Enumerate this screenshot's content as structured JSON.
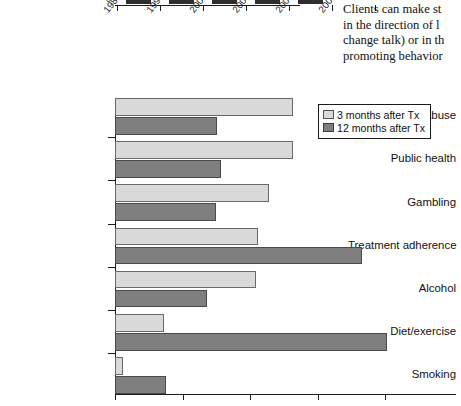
{
  "page": {
    "background": "#ffffff",
    "series_colors": {
      "light": "#d9d9d9",
      "dark": "#7f7f7f",
      "axis": "#1a1a1a"
    }
  },
  "body_text": {
    "lines": [
      "Clients can make st",
      "in the direction of l",
      "change talk) or in th",
      "promoting behavior"
    ]
  },
  "top_chart": {
    "axis_zero_label": "0",
    "tick_labels": [
      "1988–1994",
      "1995–1999",
      "2000–2002",
      "2003–2006",
      "2007–2008",
      "2009–2010"
    ]
  },
  "chart_data": {
    "type": "bar",
    "orientation": "horizontal",
    "title": "",
    "xlabel": "",
    "ylabel": "",
    "grid": false,
    "legend_position": "top-right",
    "xlim": [
      0,
      4
    ],
    "xticks": [
      0,
      1,
      2,
      3,
      4
    ],
    "categories": [
      "Drug abuse",
      "Public health",
      "Gambling",
      "Treatment adherence",
      "Alcohol",
      "Diet/exercise",
      "Smoking"
    ],
    "series": [
      {
        "name": "3 months after Tx",
        "color": "#d9d9d9",
        "values": [
          2.64,
          2.64,
          2.28,
          2.12,
          2.09,
          0.73,
          0.12
        ]
      },
      {
        "name": "12 months after Tx",
        "color": "#7f7f7f",
        "values": [
          1.51,
          1.57,
          1.49,
          3.66,
          1.36,
          4.03,
          0.75
        ]
      }
    ]
  },
  "legend": {
    "items": [
      {
        "label": "3 months after Tx",
        "swatch": "light"
      },
      {
        "label": "12 months after Tx",
        "swatch": "dark"
      }
    ]
  }
}
